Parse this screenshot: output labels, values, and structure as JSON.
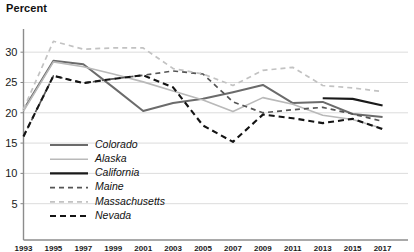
{
  "chart_data": {
    "type": "line",
    "title": "Percent",
    "xlabel": "",
    "ylabel": "Percent",
    "ylim": [
      0,
      33
    ],
    "yticks": [
      5,
      10,
      15,
      20,
      25,
      30
    ],
    "grid": true,
    "legend_position": "inside-lower-left",
    "x": [
      1993,
      1995,
      1997,
      1999,
      2001,
      2003,
      2005,
      2007,
      2009,
      2011,
      2013,
      2015,
      2017
    ],
    "categories": [
      "1993",
      "1995",
      "1997",
      "1999",
      "2001",
      "2003",
      "2005",
      "2007",
      "2009",
      "2011",
      "2013",
      "2015",
      "2017"
    ],
    "series": [
      {
        "name": "Colorado",
        "color": "#6b6b6b",
        "style": "solid",
        "width": 2.0,
        "values": [
          20.5,
          28.6,
          28.0,
          24.2,
          20.3,
          21.6,
          22.3,
          23.4,
          24.6,
          21.6,
          21.8,
          19.8,
          19.3
        ]
      },
      {
        "name": "Alaska",
        "color": "#b9b9b9",
        "style": "solid",
        "width": 1.6,
        "values": [
          20.3,
          28.4,
          27.6,
          26.4,
          25.1,
          23.6,
          22.1,
          20.2,
          22.5,
          21.4,
          19.6,
          18.9,
          17.4
        ]
      },
      {
        "name": "California",
        "color": "#1a1a1a",
        "style": "solid",
        "width": 2.2,
        "values": [
          null,
          null,
          null,
          null,
          null,
          null,
          null,
          null,
          null,
          null,
          22.4,
          22.3,
          21.2
        ]
      },
      {
        "name": "Maine",
        "color": "#555555",
        "style": "dashed",
        "width": 1.7,
        "values": [
          16.1,
          26.1,
          24.9,
          25.6,
          26.2,
          26.9,
          26.4,
          21.8,
          20.0,
          20.5,
          20.9,
          19.8,
          18.6
        ]
      },
      {
        "name": "Massachusetts",
        "color": "#c2c2c2",
        "style": "dashed",
        "width": 1.7,
        "values": [
          20.6,
          31.8,
          30.5,
          30.7,
          30.7,
          27.3,
          26.4,
          24.5,
          27.0,
          27.5,
          24.5,
          24.1,
          23.5
        ]
      },
      {
        "name": "Nevada",
        "color": "#141414",
        "style": "dashed",
        "width": 2.1,
        "values": [
          16.1,
          26.1,
          24.9,
          25.6,
          26.2,
          24.2,
          17.9,
          15.2,
          19.7,
          19.1,
          18.3,
          19.0,
          17.3
        ]
      }
    ]
  },
  "legend": {
    "items": [
      {
        "label": "Colorado"
      },
      {
        "label": "Alaska"
      },
      {
        "label": "California"
      },
      {
        "label": "Maine"
      },
      {
        "label": "Massachusetts"
      },
      {
        "label": "Nevada"
      }
    ]
  }
}
